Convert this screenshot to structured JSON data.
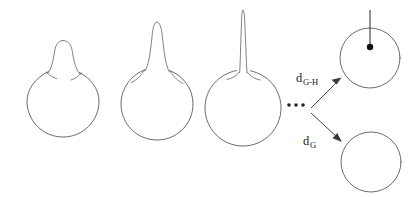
{
  "figure": {
    "background_color": "#ffffff",
    "stroke_color": "#5a5a5a",
    "dot_color": "#111111",
    "label_color": "#1a1a1a"
  },
  "sequence": {
    "ellipsis": "...",
    "shapes": [
      {
        "name": "shape-1",
        "description": "circle with short rounded bump",
        "circle": {
          "cx": 63,
          "cy": 101,
          "r": 36
        },
        "spike": {
          "height": 44,
          "half_width": 10,
          "tip_y": 40,
          "style": "rounded-bump"
        }
      },
      {
        "name": "shape-2",
        "description": "circle with tall narrow spike",
        "circle": {
          "cx": 157,
          "cy": 104,
          "r": 36
        },
        "spike": {
          "height": 72,
          "half_width": 6,
          "tip_y": 22,
          "style": "narrow-spike"
        }
      },
      {
        "name": "shape-3",
        "description": "circle with very long needle-like spike",
        "circle": {
          "cx": 243,
          "cy": 108,
          "r": 38
        },
        "spike": {
          "height": 94,
          "half_width": 3,
          "tip_y": 10,
          "style": "needle-spike"
        }
      }
    ]
  },
  "limits": {
    "upper": {
      "name": "limit-shape-with-marked-point",
      "description": "circle with filled point and vertical needle",
      "circle": {
        "cx": 370,
        "cy": 58,
        "r": 30
      },
      "point": {
        "cx": 370,
        "cy": 47,
        "r": 3.2
      },
      "needle": {
        "x": 370,
        "y_top": 10,
        "y_bottom": 47
      }
    },
    "lower": {
      "name": "limit-shape-plain-circle",
      "description": "plain circle without spike or point",
      "circle": {
        "cx": 371,
        "cy": 162,
        "r": 30
      }
    }
  },
  "arrows": [
    {
      "name": "arrow-to-gromov-hausdorff-limit",
      "from": {
        "x": 313,
        "y": 108
      },
      "to": {
        "x": 341,
        "y": 80
      },
      "label": {
        "base": "d",
        "sub": "G-H",
        "x": 296,
        "y": 82
      }
    },
    {
      "name": "arrow-to-gromov-limit",
      "from": {
        "x": 313,
        "y": 113
      },
      "to": {
        "x": 342,
        "y": 140
      },
      "label": {
        "base": "d",
        "sub": "G",
        "x": 303,
        "y": 145
      }
    }
  ],
  "ellipsis_dots": [
    {
      "cx": 289,
      "cy": 105,
      "r": 1.8
    },
    {
      "cx": 296,
      "cy": 105,
      "r": 1.8
    },
    {
      "cx": 303,
      "cy": 105,
      "r": 1.8
    }
  ]
}
